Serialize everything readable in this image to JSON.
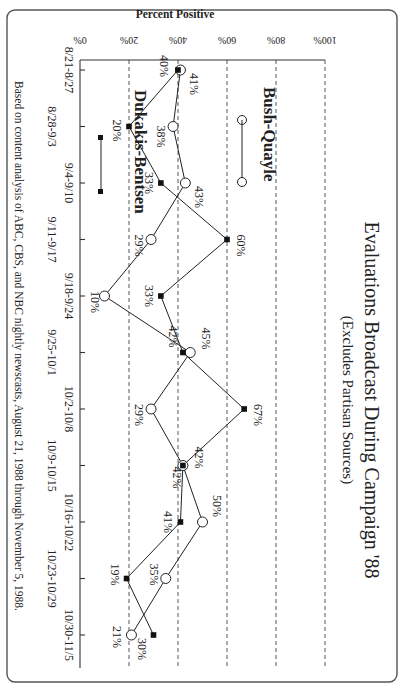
{
  "header": {
    "title": "Evaluations Broadcast During Campaign '88",
    "subtitle": "(Excludes Partisan Sources)"
  },
  "axis": {
    "ylabel": "Percent Positive",
    "yticks": [
      "0%",
      "20%",
      "40%",
      "60%",
      "80%",
      "100%"
    ]
  },
  "legend": {
    "bush": "Bush-Quayle",
    "dukakis": "Dukakis-Bentsen"
  },
  "caption": "Based on content analysis of ABC, CBS, and NBC nightly newscasts, August 21, 1988 through November 5, 1988.",
  "chart_data": {
    "type": "line",
    "title": "Evaluations Broadcast During Campaign '88",
    "subtitle": "(Excludes Partisan Sources)",
    "xlabel": "",
    "ylabel": "Percent Positive",
    "ylim": [
      0,
      100
    ],
    "yticks": [
      0,
      20,
      40,
      60,
      80,
      100
    ],
    "grid": "dashed horizontal at 20% intervals",
    "legend_position": "inside, upper-left",
    "orientation_note": "figure printed rotated 90 degrees",
    "categories": [
      "8/21-8/27",
      "8/28-9/3",
      "9/4-9/10",
      "9/11-9/17",
      "9/18-9/24",
      "9/25-10/1",
      "10/2-10/8",
      "10/9-10/15",
      "10/16-10/22",
      "10/23-10/29",
      "10/30-11/5"
    ],
    "series": [
      {
        "name": "Bush-Quayle",
        "marker": "open circle",
        "values": [
          41,
          38,
          43,
          29,
          10,
          45,
          29,
          42,
          50,
          35,
          21
        ]
      },
      {
        "name": "Dukakis-Bentsen",
        "marker": "filled square",
        "values": [
          40,
          20,
          33,
          60,
          33,
          42,
          67,
          42,
          41,
          19,
          30
        ]
      }
    ],
    "caption": "Based on content analysis of ABC, CBS, and NBC nightly newscasts, August 21, 1988 through November 5, 1988."
  }
}
